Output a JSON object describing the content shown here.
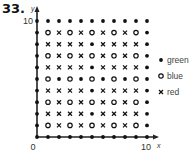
{
  "problem_number": "33.",
  "chart_data": {
    "type": "scatter",
    "title": "",
    "xlabel": "x",
    "ylabel": "y",
    "xlim": [
      0,
      10
    ],
    "ylim": [
      0,
      10
    ],
    "x_ticks": [
      "0",
      "10"
    ],
    "y_ticks": [
      "10"
    ],
    "grid": false,
    "legend_position": "right",
    "legend": [
      {
        "symbol": "dot",
        "label": "green"
      },
      {
        "symbol": "circle",
        "label": "blue"
      },
      {
        "symbol": "cross",
        "label": "red"
      }
    ],
    "grid_symbols_by_row_top_to_bottom": {
      "y10": [
        "green",
        "green",
        "green",
        "green",
        "green",
        "green",
        "green",
        "green",
        "green",
        "green",
        "green"
      ],
      "y9": [
        "green",
        "blue",
        "red",
        "blue",
        "red",
        "blue",
        "red",
        "blue",
        "red",
        "blue",
        "green"
      ],
      "y8": [
        "green",
        "red",
        "red",
        "red",
        "red",
        "green",
        "red",
        "red",
        "red",
        "red",
        "green"
      ],
      "y7": [
        "green",
        "blue",
        "red",
        "blue",
        "red",
        "blue",
        "red",
        "blue",
        "red",
        "blue",
        "green"
      ],
      "y6": [
        "green",
        "red",
        "red",
        "red",
        "red",
        "green",
        "red",
        "red",
        "red",
        "red",
        "green"
      ],
      "y5": [
        "green",
        "blue",
        "green",
        "blue",
        "green",
        "blue",
        "green",
        "blue",
        "green",
        "blue",
        "green"
      ],
      "y4": [
        "green",
        "red",
        "red",
        "red",
        "red",
        "green",
        "red",
        "red",
        "red",
        "red",
        "green"
      ],
      "y3": [
        "green",
        "blue",
        "red",
        "blue",
        "red",
        "blue",
        "red",
        "blue",
        "red",
        "blue",
        "green"
      ],
      "y2": [
        "green",
        "red",
        "red",
        "red",
        "red",
        "green",
        "red",
        "red",
        "red",
        "red",
        "green"
      ],
      "y1": [
        "green",
        "blue",
        "red",
        "blue",
        "red",
        "blue",
        "red",
        "blue",
        "red",
        "blue",
        "green"
      ],
      "y0": [
        "green",
        "green",
        "green",
        "green",
        "green",
        "green",
        "green",
        "green",
        "green",
        "green",
        "green"
      ]
    },
    "series": [
      {
        "name": "green",
        "marker": "dot",
        "count": 52
      },
      {
        "name": "blue",
        "marker": "circle",
        "count": 25
      },
      {
        "name": "red",
        "marker": "cross",
        "count": 44
      }
    ]
  },
  "labels": {
    "origin": "0",
    "x_max": "10",
    "y_max": "10",
    "x_axis": "x",
    "y_axis": "y"
  }
}
